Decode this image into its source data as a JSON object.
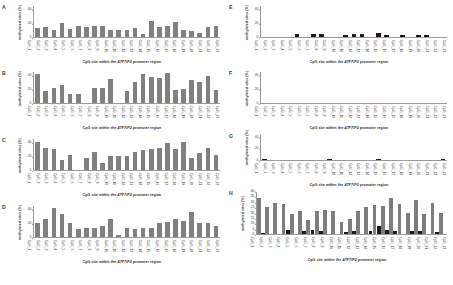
{
  "figure": {
    "axis_titles": {
      "x_prefix": "CpG site within the ",
      "x_gene": "ATF7IP2",
      "x_suffix": " promoter region",
      "x_full": "CpG site within the ATF7IP2 promoter region",
      "y": "methylated sites (%)"
    },
    "categories": [
      "CpG_1",
      "CpG_2",
      "CpG_3",
      "CpG_4",
      "CpG_5",
      "CpG_6",
      "CpG_7",
      "CpG_8",
      "CpG_9",
      "CpG_10",
      "CpG_11",
      "CpG_12",
      "CpG_13",
      "CpG_14",
      "CpG_15",
      "CpG_16",
      "CpG_17",
      "CpG_18",
      "CpG_19",
      "CpG_20",
      "CpG_21",
      "CpG_22",
      "CpG_23"
    ],
    "colors": {
      "bar_gray": "#808080",
      "bar_black": "#1c1c1c",
      "axis": "#9a9a9a",
      "text": "#2f2f2f",
      "background": "#ffffff"
    }
  },
  "panels": [
    {
      "letter": "A",
      "chart_data": {
        "type": "bar",
        "title": "",
        "xlabel": "CpG site within the ATF7IP2 promoter region",
        "ylabel": "methylated sites (%)",
        "ylim": [
          0,
          45
        ],
        "yticks": [
          0,
          20,
          40
        ],
        "grid": false,
        "legend": "none",
        "categories": [
          "CpG_1",
          "CpG_2",
          "CpG_3",
          "CpG_4",
          "CpG_5",
          "CpG_6",
          "CpG_7",
          "CpG_8",
          "CpG_9",
          "CpG_10",
          "CpG_11",
          "CpG_12",
          "CpG_13",
          "CpG_14",
          "CpG_15",
          "CpG_16",
          "CpG_17",
          "CpG_18",
          "CpG_19",
          "CpG_20",
          "CpG_21",
          "CpG_22",
          "CpG_23"
        ],
        "values": [
          14,
          15,
          10,
          20,
          12,
          17,
          15,
          16,
          16,
          10,
          11,
          11,
          13,
          5,
          23,
          15,
          16,
          22,
          10,
          9,
          6,
          15,
          17
        ]
      }
    },
    {
      "letter": "B",
      "chart_data": {
        "type": "bar",
        "title": "",
        "xlabel": "CpG site within the ATF7IP2 promoter region",
        "ylabel": "methylated sites (%)",
        "ylim": [
          0,
          45
        ],
        "yticks": [
          0,
          20,
          40
        ],
        "grid": false,
        "legend": "none",
        "categories": [
          "CpG_1",
          "CpG_2",
          "CpG_3",
          "CpG_4",
          "CpG_5",
          "CpG_6",
          "CpG_7",
          "CpG_8",
          "CpG_9",
          "CpG_10",
          "CpG_11",
          "CpG_12",
          "CpG_13",
          "CpG_14",
          "CpG_15",
          "CpG_16",
          "CpG_17",
          "CpG_18",
          "CpG_19",
          "CpG_20",
          "CpG_21",
          "CpG_22",
          "CpG_23"
        ],
        "values": [
          42,
          18,
          22,
          27,
          13,
          13,
          0,
          22,
          22,
          35,
          0,
          18,
          30,
          42,
          38,
          36,
          44,
          19,
          20,
          34,
          31,
          40,
          19
        ]
      }
    },
    {
      "letter": "C",
      "chart_data": {
        "type": "bar",
        "title": "",
        "xlabel": "CpG site within the ATF7IP2 promoter region",
        "ylabel": "methylated sites (%)",
        "ylim": [
          0,
          45
        ],
        "yticks": [
          0,
          20,
          40
        ],
        "grid": false,
        "legend": "none",
        "categories": [
          "CpG_1",
          "CpG_2",
          "CpG_3",
          "CpG_4",
          "CpG_5",
          "CpG_6",
          "CpG_7",
          "CpG_8",
          "CpG_9",
          "CpG_10",
          "CpG_11",
          "CpG_12",
          "CpG_13",
          "CpG_14",
          "CpG_15",
          "CpG_16",
          "CpG_17",
          "CpG_18",
          "CpG_19",
          "CpG_20",
          "CpG_21",
          "CpG_22",
          "CpG_23"
        ],
        "values": [
          41,
          32,
          31,
          15,
          22,
          0,
          18,
          26,
          11,
          20,
          20,
          20,
          26,
          29,
          31,
          32,
          40,
          30,
          41,
          18,
          25,
          32,
          22
        ]
      }
    },
    {
      "letter": "D",
      "chart_data": {
        "type": "bar",
        "title": "",
        "xlabel": "CpG site within the ATF7IP2 promoter region",
        "ylabel": "methylated sites (%)",
        "ylim": [
          0,
          45
        ],
        "yticks": [
          0,
          20,
          40
        ],
        "grid": false,
        "legend": "none",
        "categories": [
          "CpG_1",
          "CpG_2",
          "CpG_3",
          "CpG_4",
          "CpG_5",
          "CpG_6",
          "CpG_7",
          "CpG_8",
          "CpG_9",
          "CpG_10",
          "CpG_11",
          "CpG_12",
          "CpG_13",
          "CpG_14",
          "CpG_15",
          "CpG_16",
          "CpG_17",
          "CpG_18",
          "CpG_19",
          "CpG_20",
          "CpG_21",
          "CpG_22",
          "CpG_23"
        ],
        "values": [
          20,
          27,
          42,
          33,
          21,
          12,
          13,
          14,
          17,
          26,
          4,
          14,
          12,
          14,
          14,
          20,
          22,
          27,
          24,
          36,
          20,
          20,
          16
        ]
      }
    },
    {
      "letter": "E",
      "chart_data": {
        "type": "bar",
        "title": "",
        "xlabel": "CpG site within the ATF7IP2 promoter region",
        "ylabel": "methylated sites (%)",
        "ylim": [
          0,
          45
        ],
        "yticks": [
          0,
          20,
          40
        ],
        "grid": false,
        "legend": "none",
        "series_color": "#1c1c1c",
        "categories": [
          "CpG_1",
          "CpG_2",
          "CpG_3",
          "CpG_4",
          "CpG_5",
          "CpG_6",
          "CpG_7",
          "CpG_8",
          "CpG_9",
          "CpG_10",
          "CpG_11",
          "CpG_12",
          "CpG_13",
          "CpG_14",
          "CpG_15",
          "CpG_16",
          "CpG_17",
          "CpG_18",
          "CpG_19",
          "CpG_20",
          "CpG_21",
          "CpG_22",
          "CpG_23"
        ],
        "values": [
          0,
          0,
          0,
          0,
          5,
          0,
          5,
          5,
          0,
          0,
          4,
          5,
          5,
          0,
          7,
          4,
          0,
          3,
          0,
          4,
          4,
          0,
          0
        ]
      }
    },
    {
      "letter": "F",
      "chart_data": {
        "type": "bar",
        "title": "",
        "xlabel": "CpG site within the ATF7IP2 promoter region",
        "ylabel": "methylated sites (%)",
        "ylim": [
          0,
          45
        ],
        "yticks": [
          0,
          20,
          40
        ],
        "grid": false,
        "legend": "none",
        "series_color": "#1c1c1c",
        "categories": [
          "CpG_1",
          "CpG_2",
          "CpG_3",
          "CpG_4",
          "CpG_5",
          "CpG_6",
          "CpG_7",
          "CpG_8",
          "CpG_9",
          "CpG_10",
          "CpG_11",
          "CpG_12",
          "CpG_13",
          "CpG_14",
          "CpG_15",
          "CpG_16",
          "CpG_17",
          "CpG_18",
          "CpG_19",
          "CpG_20",
          "CpG_21",
          "CpG_22",
          "CpG_23"
        ],
        "values": [
          0,
          0,
          0,
          0,
          0,
          0,
          0,
          0,
          0,
          0,
          0,
          0,
          0,
          0,
          0,
          0,
          0,
          0,
          0,
          0,
          0,
          0,
          0
        ]
      }
    },
    {
      "letter": "G",
      "chart_data": {
        "type": "bar",
        "title": "",
        "xlabel": "CpG site within the ATF7IP2 promoter region",
        "ylabel": "methylated sites (%)",
        "ylim": [
          0,
          45
        ],
        "yticks": [
          0,
          20,
          40
        ],
        "grid": false,
        "legend": "none",
        "series_color": "#1c1c1c",
        "categories": [
          "CpG_1",
          "CpG_2",
          "CpG_3",
          "CpG_4",
          "CpG_5",
          "CpG_6",
          "CpG_7",
          "CpG_8",
          "CpG_9",
          "CpG_10",
          "CpG_11",
          "CpG_12",
          "CpG_13",
          "CpG_14",
          "CpG_15",
          "CpG_16",
          "CpG_17",
          "CpG_18",
          "CpG_19",
          "CpG_20",
          "CpG_21",
          "CpG_22",
          "CpG_23"
        ],
        "values": [
          2,
          0,
          0,
          0,
          0,
          0,
          0,
          0,
          3,
          0,
          0,
          0,
          0,
          0,
          3,
          0,
          0,
          0,
          0,
          0,
          0,
          0,
          3
        ]
      }
    },
    {
      "letter": "H",
      "chart_data": {
        "type": "bar",
        "title": "",
        "xlabel": "CpG site within the ATF7IP2 promoter region",
        "ylabel": "methylated sites (%)",
        "ylim": [
          0,
          40
        ],
        "yticks": [
          0,
          5,
          10,
          15,
          20,
          25,
          30,
          35,
          40
        ],
        "grid": false,
        "legend": "none",
        "categories": [
          "CpG_1",
          "CpG_2",
          "CpG_3",
          "CpG_4",
          "CpG_5",
          "CpG_6",
          "CpG_7",
          "CpG_8",
          "CpG_9",
          "CpG_10",
          "CpG_11",
          "CpG_12",
          "CpG_13",
          "CpG_14",
          "CpG_15",
          "CpG_16",
          "CpG_17",
          "CpG_18",
          "CpG_19",
          "CpG_20",
          "CpG_21",
          "CpG_22",
          "CpG_23"
        ],
        "series": [
          {
            "name": "gray",
            "color": "#7d7d7d",
            "values": [
              34,
              26,
              30,
              29,
              19,
              22,
              14,
              22,
              23,
              22,
              12,
              15,
              22,
              26,
              28,
              27,
              34,
              29,
              20,
              32,
              19,
              30,
              20
            ]
          },
          {
            "name": "black",
            "color": "#1c1c1c",
            "values": [
              1,
              0,
              0,
              4,
              0,
              3,
              4,
              3,
              0,
              0,
              2,
              3,
              0,
              3,
              8,
              4,
              3,
              0,
              3,
              3,
              0,
              2,
              0
            ]
          }
        ]
      }
    }
  ]
}
